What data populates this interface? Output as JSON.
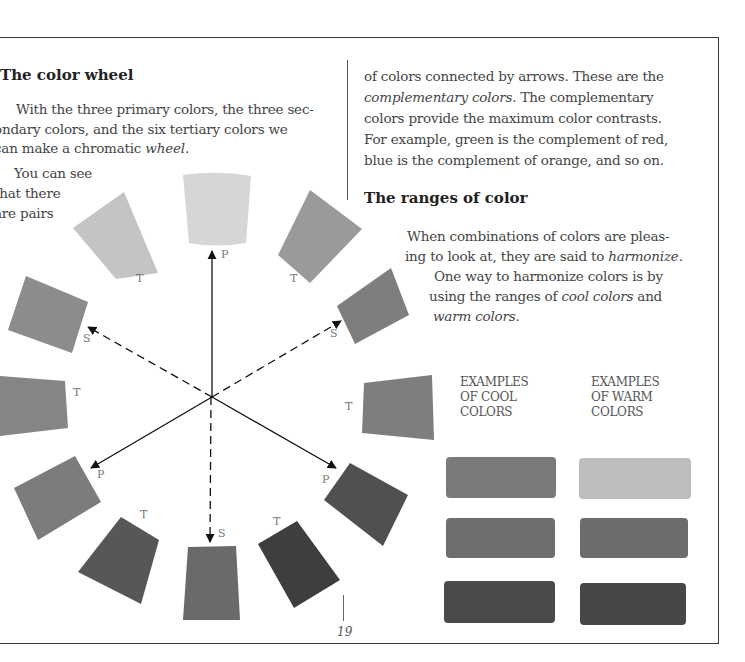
{
  "page": {
    "number": "19"
  },
  "left_column": {
    "heading": "The color wheel",
    "paragraph_lines": [
      "With the three primary colors, the three sec-",
      "ondary colors, and the six tertiary colors we",
      "can make a chromatic"
    ],
    "paragraph_italic_end": "wheel",
    "paragraph_end_punct": ".",
    "wrap_lines": [
      "You can see",
      "that there",
      "are pairs"
    ]
  },
  "right_column": {
    "continuation_line1": "of colors connected by arrows. These are the",
    "continuation_line2_italic": "complementary colors",
    "continuation_line2_rest": ". The complementary",
    "continuation_line3": "colors provide the maximum color contrasts.",
    "continuation_line4": "For example, green is the complement of red,",
    "continuation_line5": "blue is the complement of orange, and so on.",
    "heading": "The ranges of color",
    "harmonize_line1": "When combinations of colors are pleas-",
    "harmonize_line2_pre": "ing to look at, they are said to ",
    "harmonize_line2_italic": "harmonize",
    "harmonize_line2_post": ".",
    "ranges_line1": "One way to harmonize colors is by",
    "ranges_line2_pre": "using the ranges of ",
    "ranges_line2_italic": "cool colors",
    "ranges_line2_post": " and",
    "ranges_line3_italic": "warm colors",
    "ranges_line3_post": "."
  },
  "examples": {
    "cool_label": [
      "EXAMPLES",
      "OF COOL",
      "COLORS"
    ],
    "warm_label": [
      "EXAMPLES",
      "OF WARM",
      "COLORS"
    ],
    "cool_swatches": [
      "#7a7a7a",
      "#6e6e6e",
      "#4a4a4a"
    ],
    "warm_swatches": [
      "#bdbdbd",
      "#6c6c6c",
      "#464646"
    ]
  },
  "wheel": {
    "labels": {
      "top": "P",
      "top_left": "T",
      "top_right": "T",
      "upper_left": "S",
      "upper_right": "S",
      "left": "T",
      "right": "T",
      "lower_left": "P",
      "lower_right": "P",
      "bottom_left": "T",
      "bottom": "S",
      "bottom_right": "T"
    },
    "swatch_colors": {
      "top": "#d6d6d6",
      "top_left": "#c4c4c4",
      "top_right": "#9a9a9a",
      "upper_left": "#8c8c8c",
      "upper_right": "#7e7e7e",
      "left": "#858585",
      "right": "#7e7e7e",
      "lower_left": "#7c7c7c",
      "lower_right": "#505050",
      "bottom_left": "#575757",
      "bottom": "#6a6a6a",
      "bottom_right": "#3e3e3e"
    }
  }
}
